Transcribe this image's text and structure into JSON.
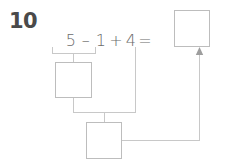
{
  "problem": {
    "number": "10",
    "equation": {
      "operand_1": "5",
      "operator_1": "–",
      "operand_2": "1",
      "operator_2": "+",
      "operand_3": "4",
      "equals": "="
    },
    "full_text": "5 – 1 + 4 =",
    "answer_box_value": "",
    "work_box_1_value": "",
    "work_box_2_value": ""
  },
  "colors": {
    "number_text": "#4a4a4a",
    "equation_text": "#6b6b6b",
    "box_border": "#bdbdbd",
    "connector_line": "#c8c8c8",
    "background": "#ffffff"
  },
  "icons": {
    "arrow_up": "arrow-up-icon"
  }
}
